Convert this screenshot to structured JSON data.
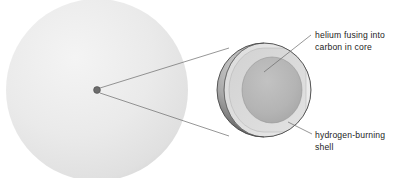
{
  "diagram": {
    "background_color": "#ffffff",
    "star": {
      "name": "main-star-sphere",
      "fill_light": "#f2f2f2",
      "fill_mid": "#e4e4e4",
      "fill_edge": "#d9d9d9",
      "center_dot_color": "#6d6d6d",
      "center_dot_label": "core-point"
    },
    "magnified_core": {
      "outer_surface_dark": "#3b3b3b",
      "outer_surface_highlight": "#cfcfcf",
      "cut_face_outer": "#e6e6e6",
      "cut_face_shell": "#dcdcdc",
      "inner_core_fill": "#b4b4b4",
      "outline_color": "#4a4a4a"
    },
    "leader_line_color": "#6a6a6a",
    "labels": [
      {
        "id": "helium-core-label",
        "line1": "helium fusing into",
        "line2": "carbon in core"
      },
      {
        "id": "hydrogen-shell-label",
        "line1": "hydrogen-burning",
        "line2": "shell"
      }
    ]
  }
}
